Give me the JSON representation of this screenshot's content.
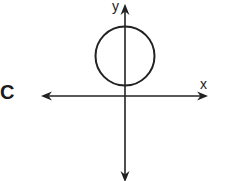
{
  "option": {
    "label": "C"
  },
  "axes": {
    "x_label": "x",
    "y_label": "y",
    "color": "#222222"
  },
  "figure": {
    "shape": "circle",
    "center": {
      "x": 0,
      "y": "positive"
    },
    "tangent_to": "x-axis"
  }
}
